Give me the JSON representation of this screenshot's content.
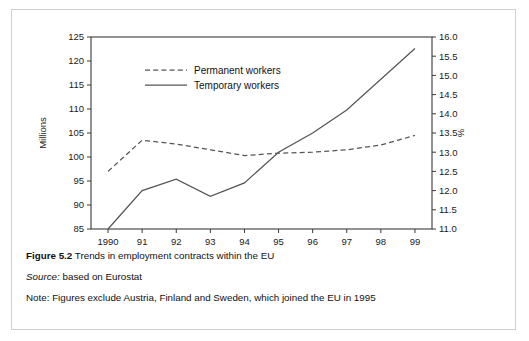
{
  "figure": {
    "label_bold": "Figure 5.2",
    "title": "Trends in employment contracts within the EU",
    "source_label": "Source:",
    "source_text": "based on Eurostat",
    "note_text": "Note: Figures exclude Austria, Finland and Sweden, which joined the EU in 1995"
  },
  "chart_data": {
    "type": "line",
    "title": "Trends in employment contracts within the EU",
    "xlabel": "",
    "ylabel": "Millions",
    "y2label": "%",
    "grid": false,
    "legend_position": "top-center",
    "x": [
      "1990",
      "91",
      "92",
      "93",
      "94",
      "95",
      "96",
      "97",
      "98",
      "99"
    ],
    "xtick_labels": [
      "1990",
      "91",
      "92",
      "93",
      "94",
      "95",
      "96",
      "97",
      "98",
      "99"
    ],
    "ylim": [
      85,
      125
    ],
    "ytick_labels": [
      "85",
      "90",
      "95",
      "100",
      "105",
      "110",
      "115",
      "120",
      "125"
    ],
    "ytick_values": [
      85,
      90,
      95,
      100,
      105,
      110,
      115,
      120,
      125
    ],
    "y2lim": [
      11.0,
      16.0
    ],
    "y2tick_labels": [
      "11.0",
      "11.5",
      "12.0",
      "12.5",
      "13.0",
      "13.5",
      "14.0",
      "14.5",
      "15.0",
      "15.5",
      "16.0"
    ],
    "y2tick_values": [
      11.0,
      11.5,
      12.0,
      12.5,
      13.0,
      13.5,
      14.0,
      14.5,
      15.0,
      15.5,
      16.0
    ],
    "series": [
      {
        "name": "Permanent workers",
        "axis": "left",
        "style": "dashed",
        "color": "#555555",
        "unit": "Millions",
        "values": [
          97.0,
          103.5,
          102.7,
          101.5,
          100.3,
          100.8,
          101.0,
          101.5,
          102.5,
          104.5
        ]
      },
      {
        "name": "Temporary workers",
        "axis": "right",
        "style": "solid",
        "color": "#555555",
        "unit": "%",
        "values": [
          11.0,
          12.0,
          12.3,
          11.85,
          12.2,
          13.0,
          13.5,
          14.1,
          14.9,
          15.7
        ]
      }
    ]
  }
}
